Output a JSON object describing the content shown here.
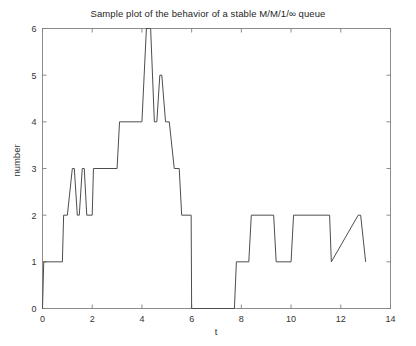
{
  "chart_data": {
    "type": "line",
    "title": "Sample plot of the behavior of a stable M/M/1/∞ queue",
    "xlabel": "t",
    "ylabel": "number",
    "xlim": [
      0,
      14
    ],
    "ylim": [
      0,
      6
    ],
    "xticks": [
      0,
      2,
      4,
      6,
      8,
      10,
      12,
      14
    ],
    "yticks": [
      0,
      1,
      2,
      3,
      4,
      5,
      6
    ],
    "xtick_labels": [
      "0",
      "2",
      "4",
      "6",
      "8",
      "10",
      "12",
      "14"
    ],
    "ytick_labels": [
      "0",
      "1",
      "2",
      "3",
      "4",
      "5",
      "6"
    ],
    "grid": false,
    "legend": null,
    "line_color": "#4d4d4d",
    "step_type": "post",
    "series": [
      {
        "name": "queue length",
        "t": [
          0.0,
          0.05,
          0.8,
          0.85,
          1.0,
          1.2,
          1.28,
          1.4,
          1.48,
          1.6,
          1.68,
          1.78,
          2.0,
          2.05,
          3.0,
          3.1,
          3.9,
          4.0,
          4.18,
          4.35,
          4.5,
          4.6,
          4.72,
          4.8,
          4.95,
          5.1,
          5.3,
          5.5,
          5.6,
          5.98,
          6.0,
          7.72,
          7.8,
          8.3,
          8.4,
          9.3,
          9.4,
          10.0,
          10.1,
          11.55,
          11.62,
          12.7,
          12.8,
          13.0
        ],
        "n": [
          0,
          1,
          1,
          2,
          2,
          3,
          3,
          2,
          2,
          3,
          3,
          2,
          2,
          3,
          3,
          4,
          4,
          4,
          6,
          6,
          4,
          4,
          5,
          5,
          4,
          4,
          3,
          3,
          2,
          2,
          0,
          0,
          1,
          1,
          2,
          2,
          1,
          1,
          2,
          2,
          1,
          2,
          2,
          1
        ],
        "points": [
          {
            "t": 0.0,
            "n": 0,
            "event": "start"
          },
          {
            "t": 0.05,
            "n": 1,
            "event": "arrival"
          },
          {
            "t": 0.85,
            "n": 2,
            "event": "arrival"
          },
          {
            "t": 1.2,
            "n": 3,
            "event": "arrival"
          },
          {
            "t": 1.4,
            "n": 2,
            "event": "departure"
          },
          {
            "t": 1.6,
            "n": 3,
            "event": "arrival"
          },
          {
            "t": 1.78,
            "n": 2,
            "event": "departure"
          },
          {
            "t": 2.05,
            "n": 3,
            "event": "arrival"
          },
          {
            "t": 3.1,
            "n": 4,
            "event": "arrival"
          },
          {
            "t": 4.18,
            "n": 6,
            "event": "arrival"
          },
          {
            "t": 4.5,
            "n": 4,
            "event": "departure"
          },
          {
            "t": 4.72,
            "n": 5,
            "event": "arrival"
          },
          {
            "t": 4.95,
            "n": 4,
            "event": "departure"
          },
          {
            "t": 5.3,
            "n": 3,
            "event": "departure"
          },
          {
            "t": 5.6,
            "n": 2,
            "event": "departure"
          },
          {
            "t": 6.0,
            "n": 0,
            "event": "empty"
          },
          {
            "t": 7.8,
            "n": 1,
            "event": "arrival"
          },
          {
            "t": 8.4,
            "n": 2,
            "event": "arrival"
          },
          {
            "t": 9.4,
            "n": 1,
            "event": "departure"
          },
          {
            "t": 10.1,
            "n": 2,
            "event": "arrival"
          },
          {
            "t": 11.58,
            "n": 1,
            "event": "departure"
          },
          {
            "t": 11.62,
            "n": 2,
            "event": "arrival"
          },
          {
            "t": 12.8,
            "n": 1,
            "event": "departure"
          }
        ]
      }
    ]
  },
  "figure": {
    "background_color": "#ffffff",
    "axis_color": "#808080",
    "text_color": "#333333"
  }
}
